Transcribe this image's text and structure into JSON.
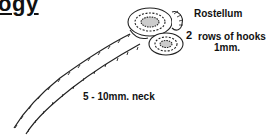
{
  "title": "ogy",
  "labels": {
    "rostellum": "Rostellum",
    "hooks_count": "2",
    "hooks": "rows of hooks",
    "hooks_size": "1mm.",
    "neck": "5 - 10mm. neck"
  },
  "colors": {
    "ink": "#111111",
    "background": "#ffffff"
  }
}
